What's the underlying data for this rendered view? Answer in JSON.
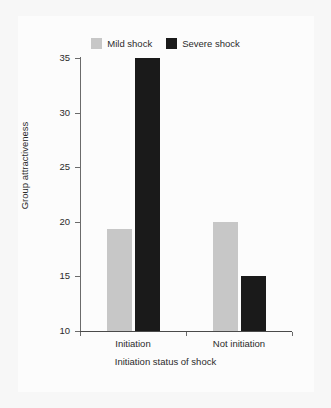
{
  "chart_data": {
    "type": "bar",
    "title": "",
    "subtitle": "",
    "xlabel": "Initiation status of shock",
    "ylabel": "Group attractiveness",
    "categories": [
      "Initiation",
      "Not initiation"
    ],
    "series": [
      {
        "name": "Mild shock",
        "color": "#c7c7c7",
        "values": [
          19.3,
          20.0
        ]
      },
      {
        "name": "Severe shock",
        "color": "#1a1a1a",
        "values": [
          35.0,
          15.0
        ]
      }
    ],
    "ylim": [
      10,
      35
    ],
    "yticks": [
      10,
      15,
      20,
      25,
      30,
      35
    ],
    "ytick_labels": [
      "10",
      "15",
      "20",
      "25",
      "30",
      "35"
    ],
    "grid": false,
    "legend_position": "top-center"
  },
  "figure": {
    "background_color": "#f7f7f7",
    "panel_color": "#fcfcfc",
    "axis_color": "#6b6b6b",
    "text_color": "#2b2b2b"
  },
  "legend": {
    "entries": [
      {
        "label": "Mild shock",
        "color": "#c7c7c7"
      },
      {
        "label": "Severe shock",
        "color": "#1a1a1a"
      }
    ]
  }
}
